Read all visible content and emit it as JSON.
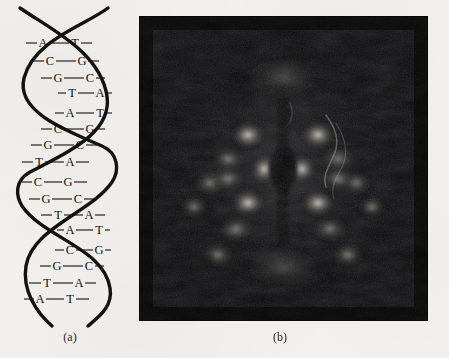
{
  "figure": {
    "background_color": "#f3f2ef",
    "ink_color": "#14120f"
  },
  "panel_a": {
    "caption": "(a)",
    "kind": "dna-double-helix-diagram",
    "strand_color": "#14120f",
    "turns": [
      {
        "index": 1,
        "base_pairs": [
          {
            "left": "A",
            "right": "T",
            "link": "–"
          },
          {
            "left": "C",
            "right": "G",
            "link": "—"
          },
          {
            "left": "G",
            "right": "C",
            "link": "—"
          },
          {
            "left": "T",
            "right": "A",
            "link": "·"
          }
        ]
      },
      {
        "index": 2,
        "base_pairs": [
          {
            "left": "A",
            "right": "T",
            "link": "–"
          },
          {
            "left": "C",
            "right": "G",
            "link": "—"
          },
          {
            "left": "G",
            "right": "C",
            "link": "—"
          },
          {
            "left": "T",
            "right": "A",
            "link": "—"
          }
        ]
      },
      {
        "index": 3,
        "base_pairs": [
          {
            "left": "C",
            "right": "G",
            "link": "–"
          },
          {
            "left": "G",
            "right": "C",
            "link": "—"
          },
          {
            "left": "T",
            "right": "A",
            "link": "—"
          },
          {
            "left": "A",
            "right": "T",
            "link": "·"
          }
        ]
      },
      {
        "index": 4,
        "base_pairs": [
          {
            "left": "C",
            "right": "G",
            "link": "–"
          },
          {
            "left": "G",
            "right": "C",
            "link": "—"
          },
          {
            "left": "T",
            "right": "A",
            "link": "—"
          },
          {
            "left": "A",
            "right": "T",
            "link": "–"
          }
        ]
      }
    ],
    "base_pair_rows": [
      {
        "id": "r1",
        "left": "A",
        "right": "T",
        "y": 47,
        "lx": 43,
        "rx": 75,
        "x0": 26,
        "x1": 92
      },
      {
        "id": "r2",
        "left": "C",
        "right": "G",
        "y": 65,
        "lx": 50,
        "rx": 82,
        "x0": 33,
        "x1": 99
      },
      {
        "id": "r3",
        "left": "G",
        "right": "C",
        "y": 82,
        "lx": 58,
        "rx": 90,
        "x0": 41,
        "x1": 105
      },
      {
        "id": "r4",
        "left": "T",
        "right": "A",
        "y": 97,
        "lx": 72,
        "rx": 100,
        "x0": 58,
        "x1": 112
      },
      {
        "id": "r5",
        "left": "A",
        "right": "T",
        "y": 117,
        "lx": 70,
        "rx": 100,
        "x0": 55,
        "x1": 112
      },
      {
        "id": "r6",
        "left": "C",
        "right": "G",
        "y": 133,
        "lx": 58,
        "rx": 90,
        "x0": 41,
        "x1": 105
      },
      {
        "id": "r7",
        "left": "G",
        "right": "C",
        "y": 149,
        "lx": 48,
        "rx": 80,
        "x0": 31,
        "x1": 97
      },
      {
        "id": "r8",
        "left": "T",
        "right": "A",
        "y": 166,
        "lx": 39,
        "rx": 70,
        "x0": 22,
        "x1": 89
      },
      {
        "id": "r9",
        "left": "C",
        "right": "G",
        "y": 186,
        "lx": 38,
        "rx": 68,
        "x0": 22,
        "x1": 87
      },
      {
        "id": "r10",
        "left": "G",
        "right": "C",
        "y": 203,
        "lx": 46,
        "rx": 78,
        "x0": 29,
        "x1": 95
      },
      {
        "id": "r11",
        "left": "T",
        "right": "A",
        "y": 219,
        "lx": 58,
        "rx": 89,
        "x0": 41,
        "x1": 105
      },
      {
        "id": "r12",
        "left": "A",
        "right": "T",
        "y": 234,
        "lx": 70,
        "rx": 99,
        "x0": 57,
        "x1": 110
      },
      {
        "id": "r13",
        "left": "C",
        "right": "G",
        "y": 254,
        "lx": 70,
        "rx": 99,
        "x0": 55,
        "x1": 111
      },
      {
        "id": "r14",
        "left": "G",
        "right": "C",
        "y": 270,
        "lx": 57,
        "rx": 89,
        "x0": 40,
        "x1": 104
      },
      {
        "id": "r15",
        "left": "T",
        "right": "A",
        "y": 287,
        "lx": 47,
        "rx": 79,
        "x0": 29,
        "x1": 96
      },
      {
        "id": "r16",
        "left": "A",
        "right": "T",
        "y": 303,
        "lx": 40,
        "rx": 70,
        "x0": 24,
        "x1": 89
      }
    ]
  },
  "panel_b": {
    "caption": "(b)",
    "kind": "x-ray-diffraction-photograph",
    "background_color": "#08080a",
    "description_tokens": {
      "pattern": "cross-shaped-x-reflections",
      "center": "dark-beam-stop",
      "meridian": "strong-top-and-bottom-arcs"
    }
  }
}
